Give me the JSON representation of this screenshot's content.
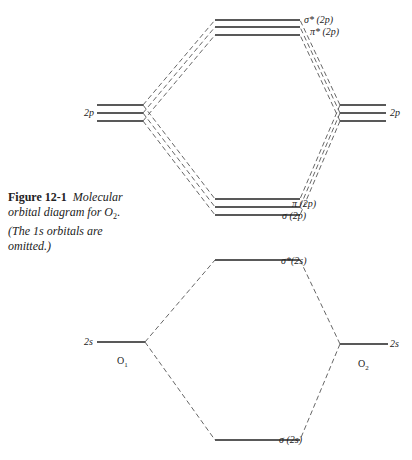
{
  "caption": {
    "label": "Figure 12-1",
    "text_line1": "Molecular",
    "text_line2": "orbital diagram for O",
    "text_sub": "2",
    "text_line2_end": ".",
    "text_line3": "(The 1s orbitals are",
    "text_line4": "omitted.)"
  },
  "labels": {
    "sigma_star_2p": "σ* (2p)",
    "pi_star_2p": "π* (2p)",
    "pi_2p": "π (2p)",
    "sigma_2p": "σ (2p)",
    "sigma_star_2s": "σ*(2s)",
    "sigma_2s": "σ (2s)",
    "left_2p": "2p",
    "right_2p": "2p",
    "left_2s": "2s",
    "right_2s": "2s"
  },
  "atoms": {
    "left": "O",
    "left_sub": "1",
    "right": "O",
    "right_sub": "2"
  },
  "colors": {
    "line": "#222222",
    "dash": "#555555"
  }
}
